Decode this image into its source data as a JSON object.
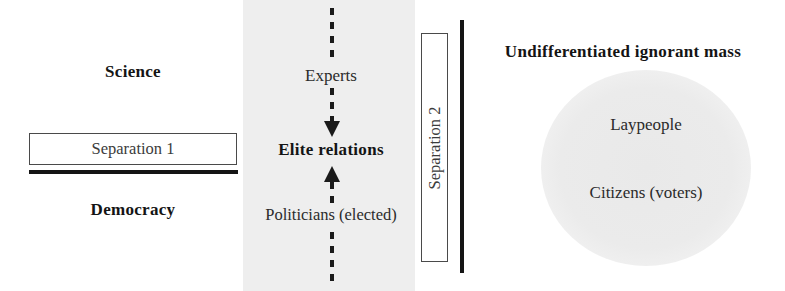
{
  "diagram": {
    "left_panel": {
      "top_label": "Science",
      "bottom_label": "Democracy",
      "separation_box_label": "Separation 1"
    },
    "middle_panel": {
      "top_label": "Experts",
      "center_label": "Elite relations",
      "bottom_label": "Politicians (elected)"
    },
    "separation2": {
      "label": "Separation 2"
    },
    "right_panel": {
      "heading": "Undifferentiated ignorant mass",
      "blob_label_top": "Laypeople",
      "blob_label_bottom": "Citizens (voters)"
    }
  }
}
